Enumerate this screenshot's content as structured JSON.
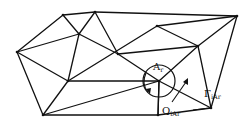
{
  "diagram": {
    "type": "triangular-mesh",
    "stroke_color": "#111111",
    "background": "#ffffff",
    "vertices": [
      {
        "id": "v1",
        "x": 17,
        "y": 52
      },
      {
        "id": "v2",
        "x": 63,
        "y": 15
      },
      {
        "id": "v3",
        "x": 95,
        "y": 12
      },
      {
        "id": "v4",
        "x": 79,
        "y": 34
      },
      {
        "id": "v5",
        "x": 68,
        "y": 81
      },
      {
        "id": "v6",
        "x": 43,
        "y": 115
      },
      {
        "id": "v7",
        "x": 118,
        "y": 54
      },
      {
        "id": "v8",
        "x": 157,
        "y": 26
      },
      {
        "id": "v9",
        "x": 237,
        "y": 16
      },
      {
        "id": "v10",
        "x": 198,
        "y": 46
      },
      {
        "id": "v11",
        "x": 159,
        "y": 81
      },
      {
        "id": "v12",
        "x": 211,
        "y": 108
      },
      {
        "id": "v13",
        "x": 158,
        "y": 115
      }
    ],
    "edges": [
      [
        "v1",
        "v2"
      ],
      [
        "v2",
        "v3"
      ],
      [
        "v2",
        "v4"
      ],
      [
        "v3",
        "v4"
      ],
      [
        "v1",
        "v4"
      ],
      [
        "v1",
        "v5"
      ],
      [
        "v1",
        "v6"
      ],
      [
        "v4",
        "v5"
      ],
      [
        "v5",
        "v6"
      ],
      [
        "v3",
        "v9"
      ],
      [
        "v3",
        "v7"
      ],
      [
        "v4",
        "v7"
      ],
      [
        "v7",
        "v11"
      ],
      [
        "v5",
        "v8"
      ],
      [
        "v8",
        "v10"
      ],
      [
        "v7",
        "v10"
      ],
      [
        "v8",
        "v9"
      ],
      [
        "v9",
        "v10"
      ],
      [
        "v9",
        "v12"
      ],
      [
        "v10",
        "v12"
      ],
      [
        "v10",
        "v11"
      ],
      [
        "v5",
        "v11"
      ],
      [
        "v6",
        "v11"
      ],
      [
        "v6",
        "v13"
      ],
      [
        "v11",
        "v13"
      ],
      [
        "v11",
        "v12"
      ],
      [
        "v13",
        "v12"
      ]
    ],
    "control_volume": {
      "center_x": 159,
      "center_y": 81,
      "radius": 16
    },
    "labels": {
      "area": {
        "main": "A",
        "sub": "r"
      },
      "flux_gamma": {
        "main": "Γ",
        "sub": "iA",
        "sub2": "r"
      },
      "flux_q": {
        "main": "Q",
        "sub": "iA",
        "sub2": "r"
      }
    }
  }
}
